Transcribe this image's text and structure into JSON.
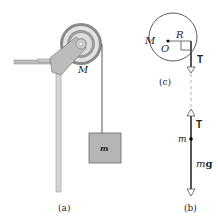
{
  "figure": {
    "panel_a": {
      "caption": "(a)",
      "pulley_label": "M",
      "block_label": "m"
    },
    "panel_c": {
      "caption": "(c)",
      "mass_label": "M",
      "center_label": "O",
      "radius_label": "R",
      "tension_label": "T"
    },
    "panel_b": {
      "caption": "(b)",
      "tension_label": "T",
      "mass_label": "m",
      "weight_label_m": "m",
      "weight_label_g": "g"
    }
  }
}
